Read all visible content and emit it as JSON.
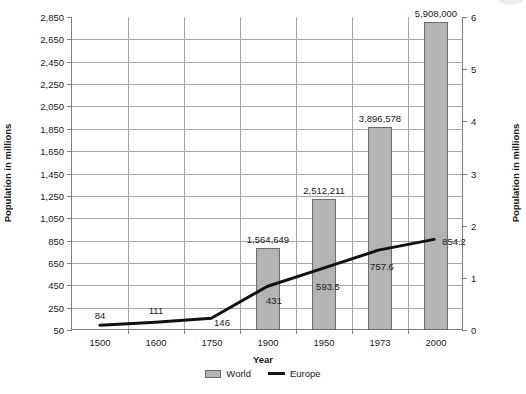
{
  "chart_data": {
    "type": "bar",
    "title": "",
    "xlabel": "Year",
    "ylabel": "Population in millions",
    "ylabel_right": "Population in millions",
    "categories": [
      "1500",
      "1600",
      "1750",
      "1900",
      "1950",
      "1973",
      "2000"
    ],
    "grid": true,
    "legend_position": "bottom",
    "ylim": [
      50,
      2850
    ],
    "ylim_right": [
      0,
      6
    ],
    "yticks": [
      "50",
      "250",
      "450",
      "650",
      "850",
      "1,050",
      "1,250",
      "1,450",
      "1,650",
      "1,850",
      "2,050",
      "2,250",
      "2,450",
      "2,650",
      "2,850"
    ],
    "yticks_right": [
      "0",
      "1",
      "2",
      "3",
      "4",
      "5",
      "6"
    ],
    "series": [
      {
        "name": "World",
        "type": "bar",
        "axis": "right",
        "color": "#b3b3b3",
        "values": [
          null,
          null,
          null,
          1.564649,
          2.512211,
          3.896578,
          5.908
        ],
        "labels": [
          "",
          "",
          "",
          "1,564,649",
          "2,512,211",
          "3,896,578",
          "5,908,000"
        ]
      },
      {
        "name": "Europe",
        "type": "line",
        "axis": "left",
        "color": "#111111",
        "values": [
          84,
          111,
          146,
          431,
          593.5,
          757.6,
          854.2
        ],
        "labels": [
          "84",
          "111",
          "146",
          "431",
          "593.5",
          "757.6",
          "854.2"
        ]
      }
    ]
  },
  "legend": {
    "world_label": "World",
    "europe_label": "Europe"
  }
}
